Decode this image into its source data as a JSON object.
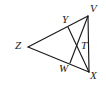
{
  "figure": {
    "type": "geometry-diagram",
    "background_color": "#ffffff",
    "stroke_color": "#1a1a1a",
    "label_color": "#1a1a1a",
    "width": 106,
    "height": 86,
    "points": {
      "Z": {
        "label": "Z",
        "x": 28,
        "y": 47,
        "label_x": 15,
        "label_y": 40
      },
      "V": {
        "label": "V",
        "x": 88,
        "y": 16,
        "label_x": 90,
        "label_y": 3
      },
      "X": {
        "label": "X",
        "x": 89,
        "y": 72,
        "label_x": 90,
        "label_y": 70
      },
      "Y": {
        "label": "Y",
        "x": 68,
        "y": 27,
        "label_x": 62,
        "label_y": 14
      },
      "W": {
        "label": "W",
        "x": 70,
        "y": 63,
        "label_x": 59,
        "label_y": 63
      },
      "T": {
        "label": "T",
        "x": 79,
        "y": 46,
        "label_x": 81,
        "label_y": 40
      }
    },
    "segments": [
      {
        "name": "segment-ZV",
        "from": "Z",
        "to": "V"
      },
      {
        "name": "segment-ZX",
        "from": "Z",
        "to": "X"
      },
      {
        "name": "segment-VX",
        "from": "V",
        "to": "X"
      },
      {
        "name": "segment-YX",
        "from": "Y",
        "to": "X"
      },
      {
        "name": "segment-WV",
        "from": "W",
        "to": "V"
      }
    ]
  }
}
